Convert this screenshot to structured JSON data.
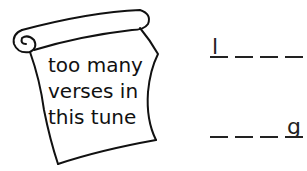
{
  "scroll": {
    "lines": [
      "too many",
      "verses in",
      "this tune"
    ]
  },
  "answers": [
    {
      "slots": [
        "l",
        "",
        "",
        ""
      ]
    },
    {
      "slots": [
        "",
        "",
        "",
        "g"
      ]
    }
  ]
}
